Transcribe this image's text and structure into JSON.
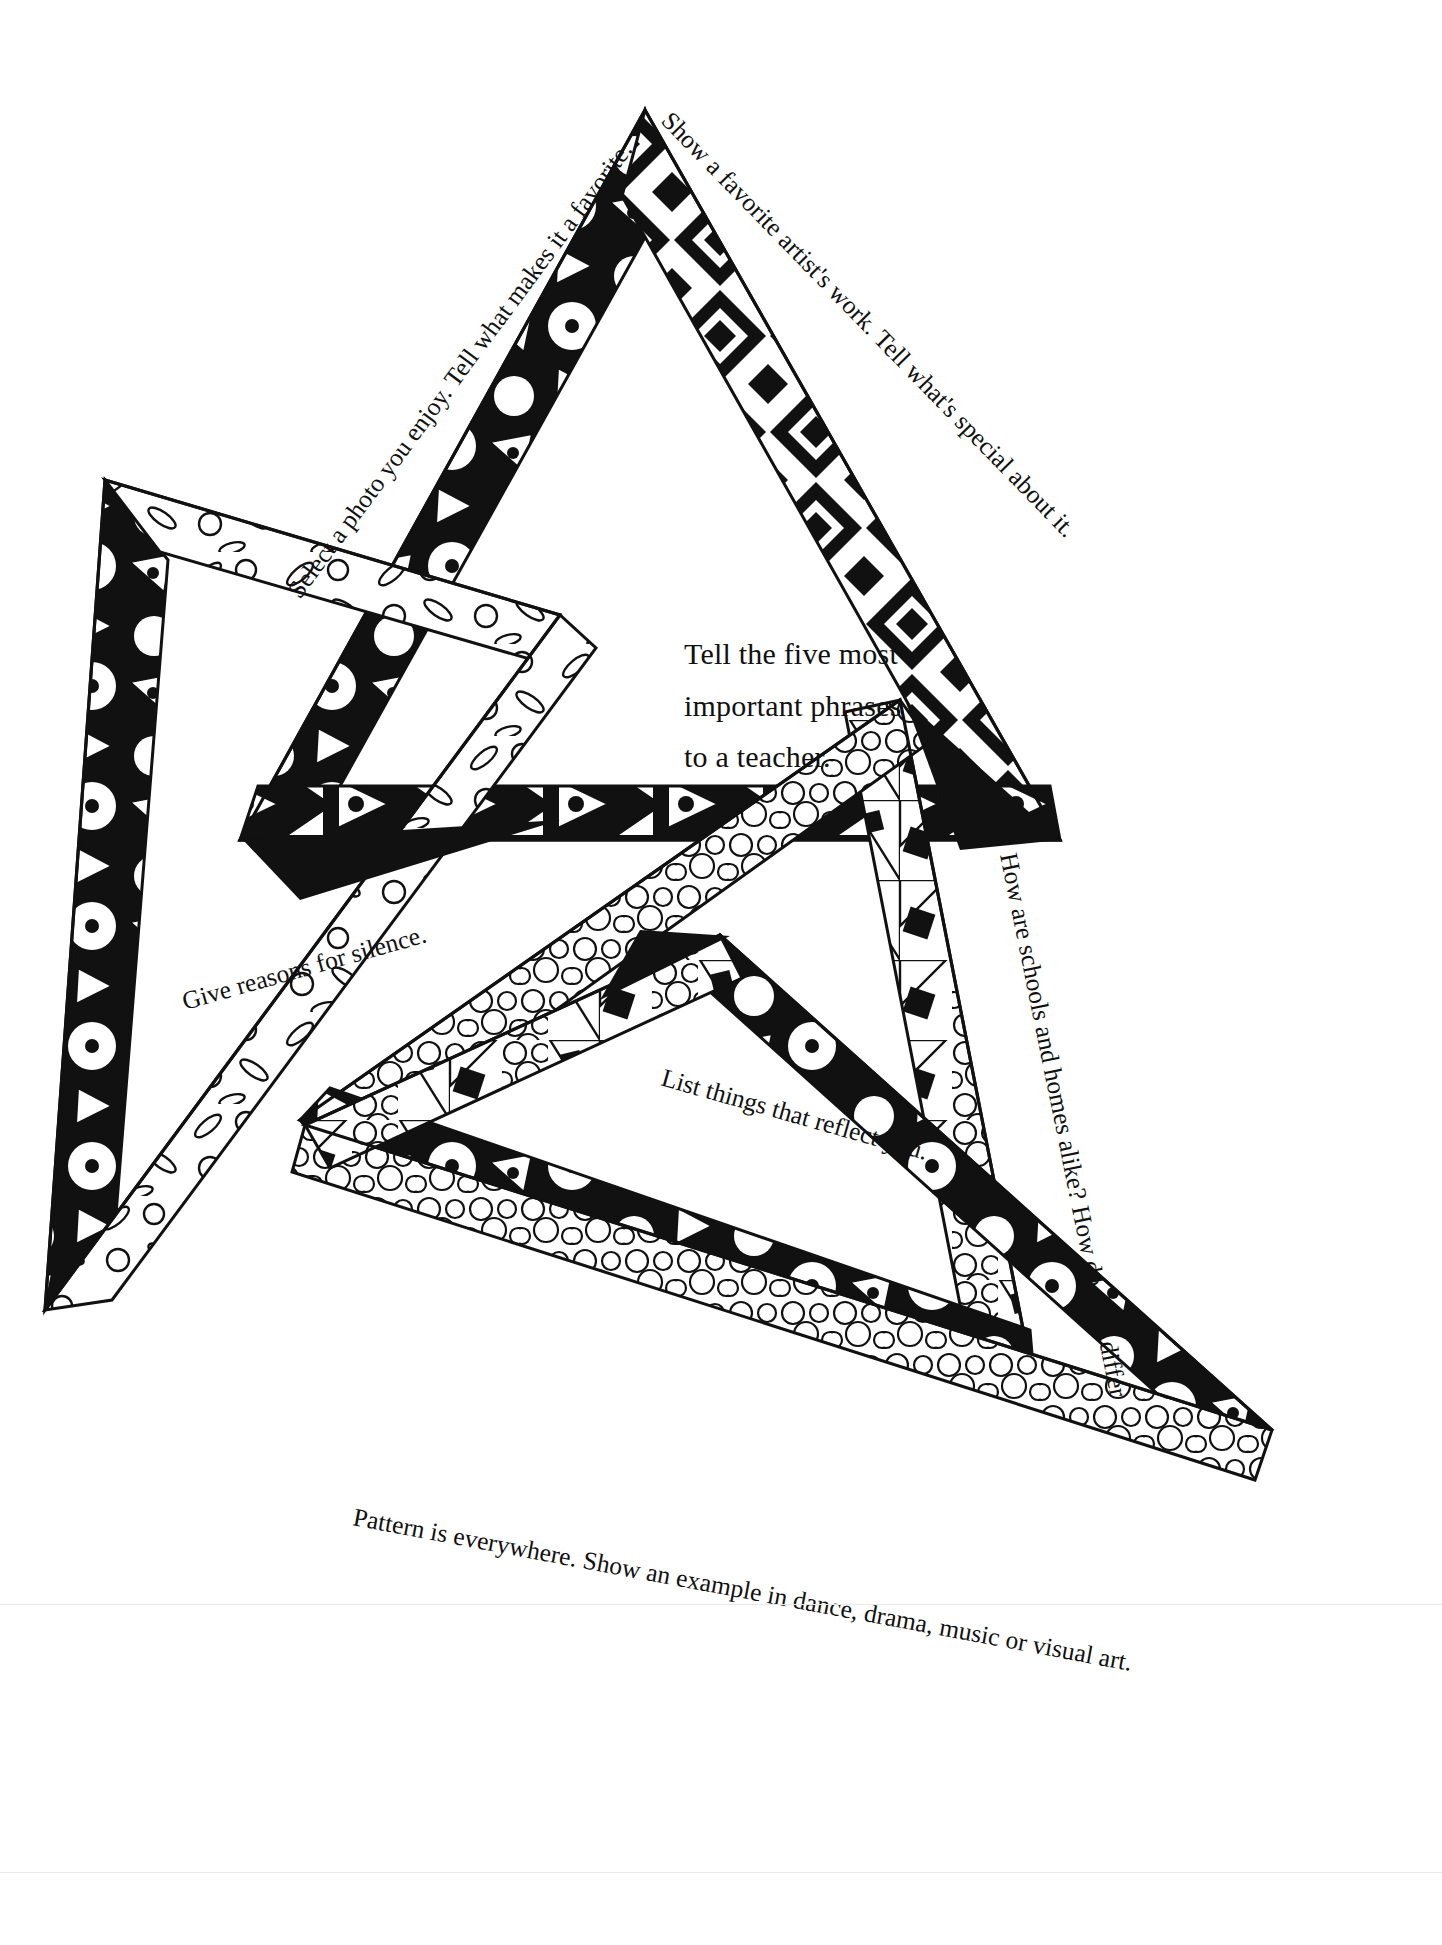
{
  "page": {
    "width": 1442,
    "height": 1945,
    "background": "#ffffff",
    "ink": "#111111"
  },
  "center_prompt": {
    "lines": [
      "Tell the five most",
      "important phrases",
      "to a teacher."
    ]
  },
  "labels": [
    {
      "id": "select-photo",
      "text": "Select a photo you enjoy. Tell what makes it a favorite.",
      "position": "upper-left-edge"
    },
    {
      "id": "favorite-artist",
      "text": "Show a favorite artist's work. Tell what's special about it.",
      "position": "upper-right-edge"
    },
    {
      "id": "give-reasons",
      "text": "Give reasons for silence.",
      "position": "middle-left"
    },
    {
      "id": "list-things",
      "text": "List things that reflect you.",
      "position": "lower-middle"
    },
    {
      "id": "schools-homes",
      "text": "How are schools and homes alike? How do they differ?",
      "position": "right-edge-vertical"
    },
    {
      "id": "pattern-everywhere",
      "text": "Pattern is everywhere. Show an example in dance, drama, music or visual art.",
      "position": "bottom-edge"
    }
  ],
  "figure": {
    "type": "overlapping-patterned-triangles",
    "count": 4,
    "fill_patterns": [
      "solid-black-with-white-circles-and-triangles",
      "black-with-white-diamonds-and-dots",
      "outlined-leaves-and-rings",
      "pebble-circles-mosaic"
    ],
    "stroke": "#111111"
  }
}
